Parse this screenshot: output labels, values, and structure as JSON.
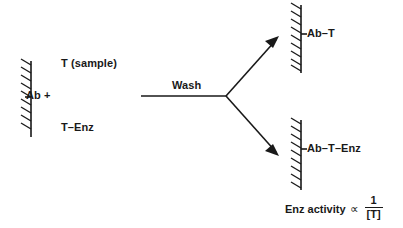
{
  "diagram": {
    "type": "reaction-scheme",
    "colors": {
      "ink": "#191919",
      "background": "#ffffff"
    },
    "reactants": {
      "solid_phase_label": "Ab +",
      "sample_label": "T (sample)",
      "conjugate_label": "T–Enz"
    },
    "step": {
      "arrow_label": "Wash"
    },
    "products": {
      "top_label": "Ab–T",
      "bottom_label": "Ab–T–Enz"
    },
    "conclusion": {
      "text": "Enz activity",
      "proportional_symbol": "∝",
      "numerator": "1",
      "denominator": "[T]"
    },
    "solid_phase_supports": [
      {
        "name": "left-support",
        "hatch_count": 9,
        "label": "Ab +"
      },
      {
        "name": "top-right-support",
        "hatch_count": 9,
        "label": "Ab–T"
      },
      {
        "name": "bottom-right-support",
        "hatch_count": 9,
        "label": "Ab–T–Enz"
      }
    ]
  }
}
